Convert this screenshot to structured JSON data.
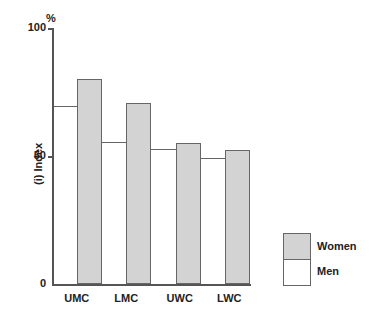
{
  "chart_data": {
    "type": "bar",
    "title": "",
    "unit_label": "%",
    "xlabel": "",
    "ylabel": "(i) Index",
    "ylim": [
      0,
      100
    ],
    "yticks": [
      0,
      50,
      100
    ],
    "grid": false,
    "legend_position": "right",
    "categories": [
      "UMC",
      "LMC",
      "UWC",
      "LWC"
    ],
    "series": [
      {
        "name": "Men",
        "color": "#ffffff",
        "values": [
          69.5,
          55.5,
          52.7,
          49.2
        ]
      },
      {
        "name": "Women",
        "color": "#d3d3d3",
        "values": [
          80,
          70.7,
          55,
          52.3
        ]
      }
    ]
  },
  "axis": {
    "unit": "%",
    "ylabel": "(i) Index",
    "ticks": [
      "100",
      "50",
      "0"
    ]
  },
  "legend": {
    "women": "Women",
    "men": "Men"
  }
}
